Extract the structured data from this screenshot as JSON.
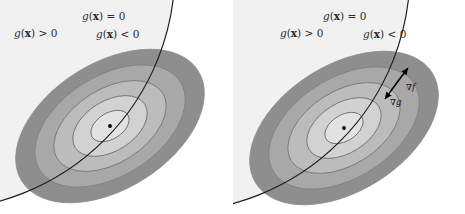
{
  "figure": {
    "panel_count": 2,
    "background": "#ffffff"
  },
  "colors": {
    "feasible_region": "#f1f1f1",
    "contour_band_1": "#e2e2e2",
    "contour_band_2": "#d2d2d2",
    "contour_band_3": "#bcbcbc",
    "contour_band_4": "#a8a8a8",
    "contour_band_5": "#8e8e8e",
    "contour_stroke": "#6e6e6e",
    "constraint_stroke": "#1b1b1b",
    "arrow": "#000000",
    "optimum_dot": "#000000",
    "label_text": "#2b2b2b"
  },
  "panels": [
    {
      "id": "left",
      "name": "inactive-constraint-panel",
      "labels": {
        "constraint_zero": {
          "text": "g(x) = 0",
          "parts": {
            "g": "g",
            "open": "(",
            "x": "x",
            "close": ")",
            "op": "=",
            "value": "0"
          },
          "x": 82,
          "y": 20
        },
        "region_positive": {
          "text": "g(x) > 0",
          "parts": {
            "g": "g",
            "open": "(",
            "x": "x",
            "close": ")",
            "op": ">",
            "value": "0"
          },
          "x": 14,
          "y": 37
        },
        "region_negative": {
          "text": "g(x) < 0",
          "parts": {
            "g": "g",
            "open": "(",
            "x": "x",
            "close": ")",
            "op": "<",
            "value": "0"
          },
          "x": 96,
          "y": 38
        }
      },
      "optimum": {
        "x": 110,
        "y": 126,
        "inside_feasible": true
      },
      "gradients_shown": false
    },
    {
      "id": "right",
      "name": "active-constraint-panel",
      "labels": {
        "constraint_zero": {
          "text": "g(x) = 0",
          "parts": {
            "g": "g",
            "open": "(",
            "x": "x",
            "close": ")",
            "op": "=",
            "value": "0"
          },
          "x": 323,
          "y": 20
        },
        "region_positive": {
          "text": "g(x) > 0",
          "parts": {
            "g": "g",
            "open": "(",
            "x": "x",
            "close": ")",
            "op": ">",
            "value": "0"
          },
          "x": 280,
          "y": 37
        },
        "region_negative": {
          "text": "g(x) < 0",
          "parts": {
            "g": "g",
            "open": "(",
            "x": "x",
            "close": ")",
            "op": "<",
            "value": "0"
          },
          "x": 363,
          "y": 38
        }
      },
      "optimum": {
        "x": 344,
        "y": 128,
        "inside_feasible": false
      },
      "gradients_shown": true,
      "gradients": [
        {
          "name": "grad-f",
          "label": "∇f",
          "label_x": 406,
          "label_y": 90,
          "from_x": 390,
          "from_y": 92,
          "to_x": 408,
          "to_y": 68
        },
        {
          "name": "grad-g",
          "label": "∇g",
          "label_x": 390,
          "label_y": 105,
          "from_x": 403,
          "from_y": 74,
          "to_x": 385,
          "to_y": 99
        }
      ]
    }
  ],
  "chart_data": {
    "type": "contour",
    "contour_levels": 5,
    "ellipse_rotation_deg": -32,
    "panels": [
      {
        "panel": "left",
        "constraint_active": false,
        "note": "Optimum lies strictly inside g(x) < 0, so the constraint is inactive."
      },
      {
        "panel": "right",
        "constraint_active": true,
        "note": "Optimum lies outside the feasible set; solution is on g(x)=0 where grad f is anti-parallel to grad g."
      }
    ],
    "legend": [
      "g(x) = 0",
      "g(x) > 0",
      "g(x) < 0",
      "∇f",
      "∇g"
    ]
  }
}
